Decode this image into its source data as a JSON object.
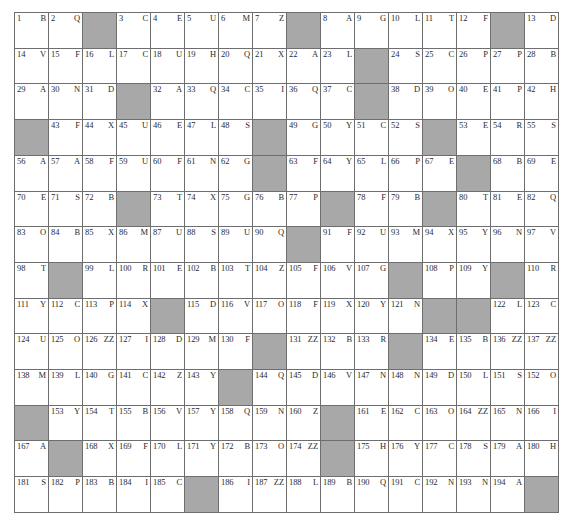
{
  "puzzle": {
    "type": "acrostic-grid",
    "rows": 14,
    "columns": 16,
    "blocked_color": "#a8a8a8",
    "cell_color": "#ffffff",
    "border_color": "#6e6e6e",
    "total_numbered_cells": 194,
    "cells": [
      [
        {
          "num": "1",
          "letter": "B"
        },
        {
          "num": "2",
          "letter": "Q"
        },
        {
          "blocked": true
        },
        {
          "num": "3",
          "letter": "C"
        },
        {
          "num": "4",
          "letter": "E"
        },
        {
          "num": "5",
          "letter": "U"
        },
        {
          "num": "6",
          "letter": "M"
        },
        {
          "num": "7",
          "letter": "Z"
        },
        {
          "blocked": true
        },
        {
          "num": "8",
          "letter": "A"
        },
        {
          "num": "9",
          "letter": "G"
        },
        {
          "num": "10",
          "letter": "L"
        },
        {
          "num": "11",
          "letter": "T"
        },
        {
          "num": "12",
          "letter": "F"
        },
        {
          "blocked": true
        },
        {
          "num": "13",
          "letter": "D"
        }
      ],
      [
        {
          "num": "14",
          "letter": "V"
        },
        {
          "num": "15",
          "letter": "F"
        },
        {
          "num": "16",
          "letter": "L"
        },
        {
          "num": "17",
          "letter": "C"
        },
        {
          "num": "18",
          "letter": "U"
        },
        {
          "num": "19",
          "letter": "H"
        },
        {
          "num": "20",
          "letter": "Q"
        },
        {
          "num": "21",
          "letter": "X"
        },
        {
          "num": "22",
          "letter": "A"
        },
        {
          "num": "23",
          "letter": "L"
        },
        {
          "blocked": true
        },
        {
          "num": "24",
          "letter": "S"
        },
        {
          "num": "25",
          "letter": "C"
        },
        {
          "num": "26",
          "letter": "P"
        },
        {
          "num": "27",
          "letter": "P"
        },
        {
          "num": "28",
          "letter": "B"
        }
      ],
      [
        {
          "num": "29",
          "letter": "A"
        },
        {
          "num": "30",
          "letter": "N"
        },
        {
          "num": "31",
          "letter": "D"
        },
        {
          "blocked": true
        },
        {
          "num": "32",
          "letter": "A"
        },
        {
          "num": "33",
          "letter": "Q"
        },
        {
          "num": "34",
          "letter": "C"
        },
        {
          "num": "35",
          "letter": "I"
        },
        {
          "num": "36",
          "letter": "Q"
        },
        {
          "num": "37",
          "letter": "C"
        },
        {
          "blocked": true
        },
        {
          "num": "38",
          "letter": "D"
        },
        {
          "num": "39",
          "letter": "O"
        },
        {
          "num": "40",
          "letter": "E"
        },
        {
          "num": "41",
          "letter": "P"
        },
        {
          "num": "42",
          "letter": "H"
        }
      ],
      [
        {
          "blocked": true
        },
        {
          "num": "43",
          "letter": "F"
        },
        {
          "num": "44",
          "letter": "X"
        },
        {
          "num": "45",
          "letter": "U"
        },
        {
          "num": "46",
          "letter": "E"
        },
        {
          "num": "47",
          "letter": "L"
        },
        {
          "num": "48",
          "letter": "S"
        },
        {
          "blocked": true
        },
        {
          "num": "49",
          "letter": "G"
        },
        {
          "num": "50",
          "letter": "Y"
        },
        {
          "num": "51",
          "letter": "C"
        },
        {
          "num": "52",
          "letter": "S"
        },
        {
          "blocked": true
        },
        {
          "num": "53",
          "letter": "E"
        },
        {
          "num": "54",
          "letter": "R"
        },
        {
          "num": "55",
          "letter": "S"
        }
      ],
      [
        {
          "num": "56",
          "letter": "A"
        },
        {
          "num": "57",
          "letter": "A"
        },
        {
          "num": "58",
          "letter": "F"
        },
        {
          "num": "59",
          "letter": "U"
        },
        {
          "num": "60",
          "letter": "F"
        },
        {
          "num": "61",
          "letter": "N"
        },
        {
          "num": "62",
          "letter": "G"
        },
        {
          "blocked": true
        },
        {
          "num": "63",
          "letter": "F"
        },
        {
          "num": "64",
          "letter": "Y"
        },
        {
          "num": "65",
          "letter": "L"
        },
        {
          "num": "66",
          "letter": "P"
        },
        {
          "num": "67",
          "letter": "E"
        },
        {
          "blocked": true
        },
        {
          "num": "68",
          "letter": "B"
        },
        {
          "num": "69",
          "letter": "E"
        }
      ],
      [
        {
          "num": "70",
          "letter": "E"
        },
        {
          "num": "71",
          "letter": "S"
        },
        {
          "num": "72",
          "letter": "B"
        },
        {
          "blocked": true
        },
        {
          "num": "73",
          "letter": "T"
        },
        {
          "num": "74",
          "letter": "X"
        },
        {
          "num": "75",
          "letter": "G"
        },
        {
          "num": "76",
          "letter": "B"
        },
        {
          "num": "77",
          "letter": "P"
        },
        {
          "blocked": true
        },
        {
          "num": "78",
          "letter": "F"
        },
        {
          "num": "79",
          "letter": "B"
        },
        {
          "blocked": true
        },
        {
          "num": "80",
          "letter": "T"
        },
        {
          "num": "81",
          "letter": "E"
        },
        {
          "num": "82",
          "letter": "Q"
        }
      ],
      [
        {
          "num": "83",
          "letter": "O"
        },
        {
          "num": "84",
          "letter": "B"
        },
        {
          "num": "85",
          "letter": "X"
        },
        {
          "num": "86",
          "letter": "M"
        },
        {
          "num": "87",
          "letter": "U"
        },
        {
          "num": "88",
          "letter": "S"
        },
        {
          "num": "89",
          "letter": "U"
        },
        {
          "num": "90",
          "letter": "Q"
        },
        {
          "blocked": true
        },
        {
          "num": "91",
          "letter": "F"
        },
        {
          "num": "92",
          "letter": "U"
        },
        {
          "num": "93",
          "letter": "M"
        },
        {
          "num": "94",
          "letter": "X"
        },
        {
          "num": "95",
          "letter": "Y"
        },
        {
          "num": "96",
          "letter": "N"
        },
        {
          "num": "97",
          "letter": "V"
        }
      ],
      [
        {
          "num": "98",
          "letter": "T"
        },
        {
          "blocked": true
        },
        {
          "num": "99",
          "letter": "L"
        },
        {
          "num": "100",
          "letter": "R"
        },
        {
          "num": "101",
          "letter": "E"
        },
        {
          "num": "102",
          "letter": "B"
        },
        {
          "num": "103",
          "letter": "T"
        },
        {
          "num": "104",
          "letter": "Z"
        },
        {
          "num": "105",
          "letter": "F"
        },
        {
          "num": "106",
          "letter": "V"
        },
        {
          "num": "107",
          "letter": "G"
        },
        {
          "blocked": true
        },
        {
          "num": "108",
          "letter": "P"
        },
        {
          "num": "109",
          "letter": "Y"
        },
        {
          "blocked": true
        },
        {
          "num": "110",
          "letter": "R"
        }
      ],
      [
        {
          "num": "111",
          "letter": "Y"
        },
        {
          "num": "112",
          "letter": "C"
        },
        {
          "num": "113",
          "letter": "P"
        },
        {
          "num": "114",
          "letter": "X"
        },
        {
          "blocked": true
        },
        {
          "num": "115",
          "letter": "D"
        },
        {
          "num": "116",
          "letter": "V"
        },
        {
          "num": "117",
          "letter": "O"
        },
        {
          "num": "118",
          "letter": "F"
        },
        {
          "num": "119",
          "letter": "X"
        },
        {
          "num": "120",
          "letter": "Y"
        },
        {
          "num": "121",
          "letter": "N"
        },
        {
          "blocked": true
        },
        {
          "blocked": true
        },
        {
          "num": "122",
          "letter": "L"
        },
        {
          "num": "123",
          "letter": "C"
        }
      ],
      [
        {
          "num": "124",
          "letter": "U"
        },
        {
          "num": "125",
          "letter": "O"
        },
        {
          "num": "126",
          "letter": "ZZ"
        },
        {
          "num": "127",
          "letter": "I"
        },
        {
          "num": "128",
          "letter": "D"
        },
        {
          "num": "129",
          "letter": "M"
        },
        {
          "num": "130",
          "letter": "F"
        },
        {
          "blocked": true
        },
        {
          "num": "131",
          "letter": "ZZ"
        },
        {
          "num": "132",
          "letter": "B"
        },
        {
          "num": "133",
          "letter": "R"
        },
        {
          "blocked": true
        },
        {
          "num": "134",
          "letter": "E"
        },
        {
          "num": "135",
          "letter": "B"
        },
        {
          "num": "136",
          "letter": "ZZ"
        },
        {
          "num": "137",
          "letter": "ZZ"
        }
      ],
      [
        {
          "num": "138",
          "letter": "M"
        },
        {
          "num": "139",
          "letter": "L"
        },
        {
          "num": "140",
          "letter": "G"
        },
        {
          "num": "141",
          "letter": "C"
        },
        {
          "num": "142",
          "letter": "Z"
        },
        {
          "num": "143",
          "letter": "Y"
        },
        {
          "blocked": true
        },
        {
          "num": "144",
          "letter": "Q"
        },
        {
          "num": "145",
          "letter": "D"
        },
        {
          "num": "146",
          "letter": "V"
        },
        {
          "num": "147",
          "letter": "N"
        },
        {
          "num": "148",
          "letter": "N"
        },
        {
          "num": "149",
          "letter": "D"
        },
        {
          "num": "150",
          "letter": "L"
        },
        {
          "num": "151",
          "letter": "S"
        },
        {
          "num": "152",
          "letter": "O"
        }
      ],
      [
        {
          "blocked": true
        },
        {
          "num": "153",
          "letter": "Y"
        },
        {
          "num": "154",
          "letter": "T"
        },
        {
          "num": "155",
          "letter": "B"
        },
        {
          "num": "156",
          "letter": "V"
        },
        {
          "num": "157",
          "letter": "Y"
        },
        {
          "num": "158",
          "letter": "Q"
        },
        {
          "num": "159",
          "letter": "N"
        },
        {
          "num": "160",
          "letter": "Z"
        },
        {
          "blocked": true
        },
        {
          "num": "161",
          "letter": "E"
        },
        {
          "num": "162",
          "letter": "C"
        },
        {
          "num": "163",
          "letter": "O"
        },
        {
          "num": "164",
          "letter": "ZZ"
        },
        {
          "num": "165",
          "letter": "N"
        },
        {
          "num": "166",
          "letter": "I"
        }
      ],
      [
        {
          "num": "167",
          "letter": "A"
        },
        {
          "blocked": true
        },
        {
          "num": "168",
          "letter": "X"
        },
        {
          "num": "169",
          "letter": "F"
        },
        {
          "num": "170",
          "letter": "L"
        },
        {
          "num": "171",
          "letter": "Y"
        },
        {
          "num": "172",
          "letter": "B"
        },
        {
          "num": "173",
          "letter": "O"
        },
        {
          "num": "174",
          "letter": "ZZ"
        },
        {
          "blocked": true
        },
        {
          "num": "175",
          "letter": "H"
        },
        {
          "num": "176",
          "letter": "Y"
        },
        {
          "num": "177",
          "letter": "C"
        },
        {
          "num": "178",
          "letter": "S"
        },
        {
          "num": "179",
          "letter": "A"
        },
        {
          "num": "180",
          "letter": "H"
        }
      ],
      [
        {
          "num": "181",
          "letter": "S"
        },
        {
          "num": "182",
          "letter": "P"
        },
        {
          "num": "183",
          "letter": "B"
        },
        {
          "num": "184",
          "letter": "I"
        },
        {
          "num": "185",
          "letter": "C"
        },
        {
          "blocked": true
        },
        {
          "num": "186",
          "letter": "I"
        },
        {
          "num": "187",
          "letter": "ZZ"
        },
        {
          "num": "188",
          "letter": "L"
        },
        {
          "num": "189",
          "letter": "B"
        },
        {
          "num": "190",
          "letter": "Q"
        },
        {
          "num": "191",
          "letter": "C"
        },
        {
          "num": "192",
          "letter": "N"
        },
        {
          "num": "193",
          "letter": "N"
        },
        {
          "num": "194",
          "letter": "A"
        },
        {
          "blocked": true
        }
      ]
    ]
  }
}
